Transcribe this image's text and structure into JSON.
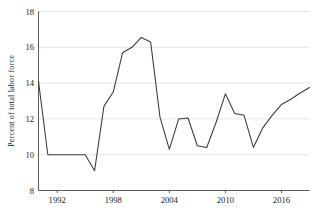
{
  "chart_data": {
    "type": "line",
    "title": "",
    "subtitle": "",
    "xlabel": "",
    "ylabel": "Percent of total labor force",
    "xlim": [
      1990,
      2019
    ],
    "ylim": [
      8,
      18
    ],
    "grid": true,
    "legend": false,
    "legend_position": "none",
    "y_ticks": [
      8,
      10,
      12,
      14,
      16,
      18
    ],
    "y_tick_labels": [
      "8",
      "10",
      "12",
      "14",
      "16",
      "18"
    ],
    "x_ticks": [
      1992,
      1998,
      2004,
      2010,
      2016
    ],
    "x_tick_labels": [
      "1992",
      "1998",
      "2004",
      "2010",
      "2016"
    ],
    "line_color": "#3b3b3b",
    "grid_color": "#d8d8d8",
    "axis_color": "#4a4a4a",
    "background_color": "#ffffff",
    "x": [
      1990,
      1991,
      1992,
      1993,
      1994,
      1995,
      1996,
      1997,
      1998,
      1999,
      2000,
      2001,
      2002,
      2003,
      2004,
      2005,
      2006,
      2007,
      2008,
      2009,
      2010,
      2011,
      2012,
      2013,
      2014,
      2015,
      2016,
      2017,
      2018,
      2019
    ],
    "values": [
      14.1,
      10.0,
      10.0,
      10.0,
      10.0,
      10.0,
      9.1,
      12.7,
      13.5,
      15.7,
      16.0,
      16.55,
      16.3,
      12.1,
      10.3,
      12.0,
      12.05,
      10.5,
      10.4,
      11.8,
      13.4,
      12.3,
      12.2,
      10.4,
      11.5,
      12.2,
      12.8,
      13.1,
      13.45,
      13.75
    ],
    "series": [
      {
        "name": "Percent of total labor force",
        "values": [
          14.1,
          10.0,
          10.0,
          10.0,
          10.0,
          10.0,
          9.1,
          12.7,
          13.5,
          15.7,
          16.0,
          16.55,
          16.3,
          12.1,
          10.3,
          12.0,
          12.05,
          10.5,
          10.4,
          11.8,
          13.4,
          12.3,
          12.2,
          10.4,
          11.5,
          12.2,
          12.8,
          13.1,
          13.45,
          13.75
        ]
      }
    ],
    "annotations": []
  }
}
